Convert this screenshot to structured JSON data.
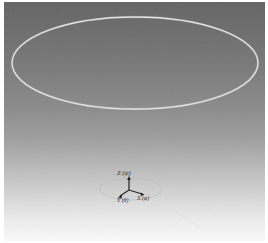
{
  "figure": {
    "width": 268,
    "height": 243,
    "border_color": "#ffffff"
  },
  "background": {
    "type": "vertical-gradient",
    "top_color": "#666666",
    "upper_mid_color": "#787878",
    "mid_color": "#8f8f8f",
    "lower_mid_color": "#c4c4c4",
    "bottom_color": "#f7f7f7"
  },
  "scene": {
    "main_ellipse": {
      "name": "large-orbit-ellipse",
      "cx": 134,
      "cy": 63,
      "rx": 124,
      "ry": 47,
      "stroke": "#e8e8e8",
      "stroke_width": 1.3
    },
    "ground_ellipse": {
      "name": "origin-base-ellipse",
      "cx": 130,
      "cy": 189,
      "rx": 31,
      "ry": 11,
      "stroke": "#bfbfbf",
      "stroke_width": 0.8
    },
    "ground_ellipse_inner": {
      "name": "origin-base-ellipse-inner",
      "cx": 130,
      "cy": 190,
      "rx": 22,
      "ry": 7,
      "stroke": "#c8c8c8",
      "stroke_width": 0.7
    },
    "horizon_line": {
      "name": "ground-reference-line",
      "x1": 152,
      "y1": 196,
      "x2": 199,
      "y2": 228,
      "stroke": "#dcdcdc",
      "stroke_width": 0.9
    }
  },
  "axis_triad": {
    "origin_x": 128,
    "origin_y": 190,
    "stroke": "#2b2b2b",
    "axes": [
      {
        "name": "z-axis",
        "label": "Z",
        "angle_symbol": "(ψ)",
        "x2": 128,
        "y2": 178
      },
      {
        "name": "y-axis",
        "label": "Y",
        "angle_symbol": "(θ)",
        "x2": 118,
        "y2": 195
      },
      {
        "name": "x-axis",
        "label": "X",
        "angle_symbol": "(φ)",
        "x2": 142,
        "y2": 193
      }
    ],
    "labels": {
      "z_text": "Z (ψ)",
      "y_text": "Y (θ)",
      "x_text": "X (φ)"
    }
  }
}
